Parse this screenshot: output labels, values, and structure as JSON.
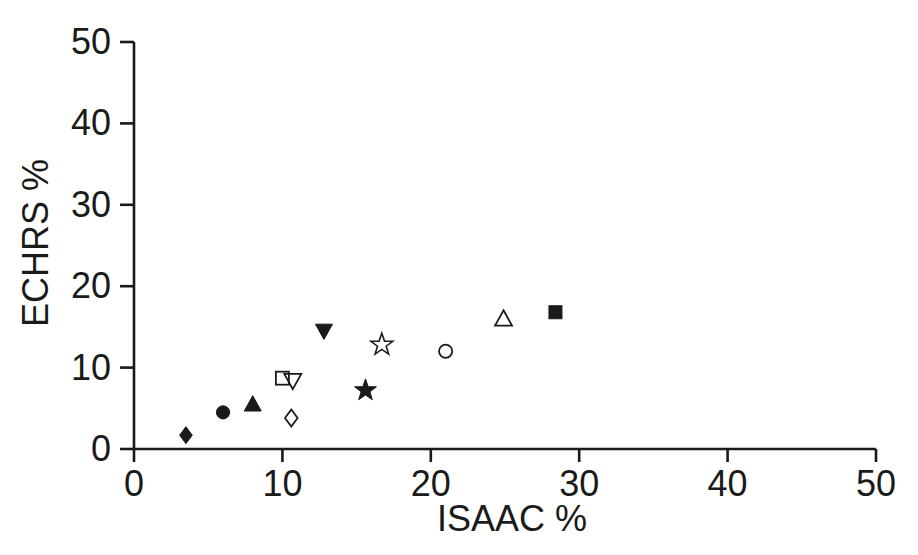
{
  "figure_title": "",
  "colors": {
    "ink": "#1a1a1a",
    "background": "#ffffff"
  },
  "chart_data": {
    "type": "scatter",
    "title": "",
    "xlabel": "ISAAC %",
    "ylabel": "ECHRS %",
    "xlim": [
      0,
      50
    ],
    "ylim": [
      0,
      50
    ],
    "xticks": [
      0,
      10,
      20,
      30,
      40,
      50
    ],
    "yticks": [
      0,
      10,
      20,
      30,
      40,
      50
    ],
    "grid": false,
    "legend_position": "none",
    "series": [
      {
        "name": "filled-diamond",
        "marker": "diamond",
        "fill": "filled",
        "x": 3.5,
        "y": 1.7
      },
      {
        "name": "filled-circle",
        "marker": "circle",
        "fill": "filled",
        "x": 6.0,
        "y": 4.5
      },
      {
        "name": "filled-triangle-up",
        "marker": "triangle-up",
        "fill": "filled",
        "x": 8.0,
        "y": 5.5
      },
      {
        "name": "open-square",
        "marker": "square",
        "fill": "open",
        "x": 10.0,
        "y": 8.7
      },
      {
        "name": "open-triangle-down",
        "marker": "triangle-down",
        "fill": "open",
        "x": 10.7,
        "y": 8.4
      },
      {
        "name": "open-diamond",
        "marker": "diamond",
        "fill": "open",
        "x": 10.6,
        "y": 3.8
      },
      {
        "name": "filled-triangle-down",
        "marker": "triangle-down",
        "fill": "filled",
        "x": 12.8,
        "y": 14.5
      },
      {
        "name": "filled-star",
        "marker": "star",
        "fill": "filled",
        "x": 15.6,
        "y": 7.2
      },
      {
        "name": "open-star",
        "marker": "star",
        "fill": "open",
        "x": 16.7,
        "y": 12.8
      },
      {
        "name": "open-circle",
        "marker": "circle",
        "fill": "open",
        "x": 21.0,
        "y": 12.0
      },
      {
        "name": "open-triangle-up",
        "marker": "triangle-up",
        "fill": "open",
        "x": 24.9,
        "y": 16.0
      },
      {
        "name": "filled-square",
        "marker": "square",
        "fill": "filled",
        "x": 28.4,
        "y": 16.8
      }
    ]
  }
}
